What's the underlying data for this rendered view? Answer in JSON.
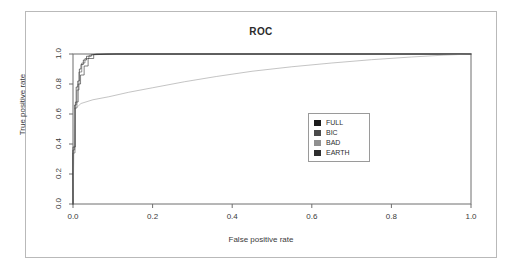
{
  "chart_data": {
    "type": "line",
    "title": "ROC",
    "xlabel": "False positive rate",
    "ylabel": "True positive rate",
    "xlim": [
      0.0,
      1.0
    ],
    "ylim": [
      0.0,
      1.0
    ],
    "grid": false,
    "legend_position": "center-right",
    "xticks": [
      "0.0",
      "0.2",
      "0.4",
      "0.6",
      "0.8",
      "1.0"
    ],
    "xtick_values": [
      0.0,
      0.2,
      0.4,
      0.6,
      0.8,
      1.0
    ],
    "yticks": [
      "0.0",
      "0.2",
      "0.4",
      "0.6",
      "0.8",
      "1.0"
    ],
    "ytick_values": [
      0.0,
      0.2,
      0.4,
      0.6,
      0.8,
      1.0
    ],
    "series": [
      {
        "name": "FULL",
        "color": "#1c1c1c",
        "x": [
          0.0,
          0.0,
          0.004,
          0.004,
          0.008,
          0.008,
          0.012,
          0.012,
          0.016,
          0.016,
          0.02,
          0.02,
          0.026,
          0.026,
          0.034,
          0.034,
          0.046,
          0.046,
          0.11,
          1.0
        ],
        "y": [
          0.0,
          0.36,
          0.36,
          0.66,
          0.66,
          0.78,
          0.78,
          0.82,
          0.82,
          0.9,
          0.9,
          0.93,
          0.93,
          0.96,
          0.96,
          0.985,
          0.985,
          0.995,
          1.0,
          1.0
        ]
      },
      {
        "name": "BIC",
        "color": "#4a4a4a",
        "x": [
          0.0,
          0.0,
          0.005,
          0.005,
          0.01,
          0.01,
          0.015,
          0.015,
          0.022,
          0.022,
          0.03,
          0.03,
          0.04,
          0.04,
          0.06,
          1.0
        ],
        "y": [
          0.0,
          0.34,
          0.34,
          0.64,
          0.64,
          0.76,
          0.76,
          0.88,
          0.88,
          0.94,
          0.94,
          0.97,
          0.97,
          0.99,
          1.0,
          1.0
        ]
      },
      {
        "name": "BAD",
        "color": "#9c9c9c",
        "x": [
          0.0,
          0.004,
          0.02,
          0.05,
          0.09,
          0.14,
          0.2,
          0.28,
          0.36,
          0.45,
          0.55,
          0.65,
          0.75,
          0.85,
          0.93,
          1.0
        ],
        "y": [
          0.0,
          0.63,
          0.67,
          0.695,
          0.715,
          0.745,
          0.775,
          0.815,
          0.85,
          0.885,
          0.915,
          0.94,
          0.962,
          0.98,
          0.992,
          1.0
        ]
      },
      {
        "name": "EARTH",
        "color": "#2e2e2e",
        "x": [
          0.0,
          0.0,
          0.006,
          0.006,
          0.013,
          0.013,
          0.019,
          0.019,
          0.028,
          0.028,
          0.038,
          0.038,
          0.052,
          0.052,
          0.085,
          1.0
        ],
        "y": [
          0.0,
          0.38,
          0.38,
          0.68,
          0.68,
          0.8,
          0.8,
          0.86,
          0.86,
          0.92,
          0.92,
          0.97,
          0.97,
          0.997,
          1.0,
          1.0
        ]
      }
    ]
  },
  "legend": {
    "items": [
      {
        "label": "FULL",
        "color": "#1c1c1c"
      },
      {
        "label": "BIC",
        "color": "#4a4a4a"
      },
      {
        "label": "BAD",
        "color": "#8f8f8f"
      },
      {
        "label": "EARTH",
        "color": "#2e2e2e"
      }
    ]
  },
  "axis_frame_color": "#6f6f6f",
  "page_border_color": "#b9b9b9"
}
